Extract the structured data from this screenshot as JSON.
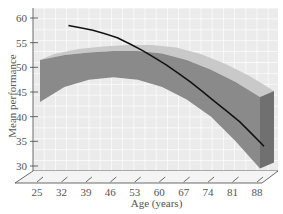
{
  "chart_data": {
    "type": "line",
    "title": "",
    "xlabel": "Age (years)",
    "ylabel": "Mean performance",
    "x_ticks": [
      25,
      32,
      39,
      46,
      53,
      60,
      67,
      74,
      81,
      88
    ],
    "y_ticks": [
      30,
      35,
      40,
      45,
      50,
      55,
      60
    ],
    "xlim": [
      25,
      88
    ],
    "ylim": [
      30,
      60
    ],
    "grid": true,
    "style": "3d-ribbon",
    "series": [
      {
        "name": "line",
        "kind": "line",
        "color": "#111111",
        "x": [
          32,
          39,
          46,
          53,
          60,
          67,
          74,
          81,
          88
        ],
        "values": [
          58.5,
          57.5,
          56,
          53.5,
          50.5,
          47,
          43,
          39,
          34
        ]
      },
      {
        "name": "band-upper",
        "kind": "band",
        "color": "#8a8a8a",
        "x": [
          25,
          32,
          39,
          46,
          53,
          60,
          67,
          74,
          81,
          88
        ],
        "values": [
          51.5,
          52.5,
          53,
          53.3,
          53.3,
          52.8,
          51.5,
          49.5,
          47,
          44
        ]
      },
      {
        "name": "band-lower",
        "kind": "band",
        "color": "#8a8a8a",
        "x": [
          25,
          32,
          39,
          46,
          53,
          60,
          67,
          74,
          81,
          88
        ],
        "values": [
          43,
          46,
          47.5,
          48,
          47.5,
          46,
          43.5,
          40,
          35,
          29.5
        ]
      }
    ],
    "colors": {
      "background": "#ebebeb",
      "grid": "#ffffff",
      "band_front": "#8a8a8a",
      "band_top": "#c9c9c9",
      "band_side": "#707070",
      "axis": "#444444",
      "text": "#555555"
    }
  }
}
